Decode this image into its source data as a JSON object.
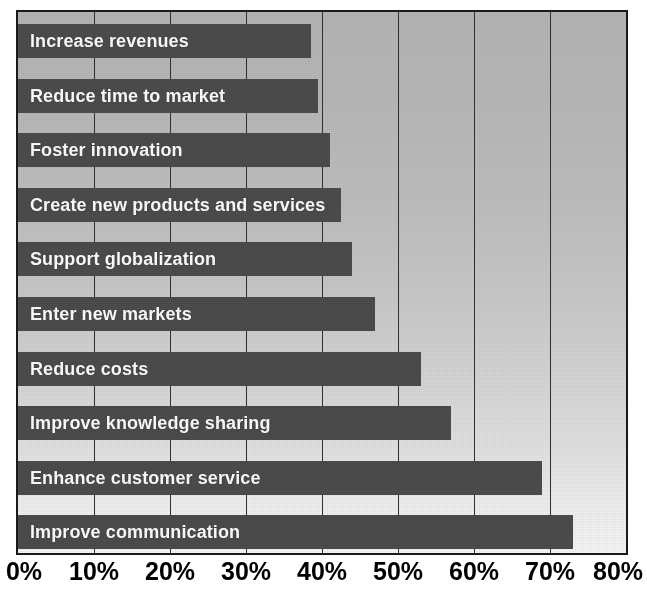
{
  "chart_data": {
    "type": "bar",
    "orientation": "horizontal",
    "title": "",
    "subtitle": "",
    "xlabel": "",
    "ylabel": "",
    "xlim": [
      0,
      80
    ],
    "xtick_labels": [
      "0%",
      "10%",
      "20%",
      "30%",
      "40%",
      "50%",
      "60%",
      "70%",
      "80%"
    ],
    "xticks": [
      0,
      10,
      20,
      30,
      40,
      50,
      60,
      70,
      80
    ],
    "grid": true,
    "grid_axis": "x",
    "legend": false,
    "legend_position": "none",
    "value_suffix": "%",
    "categories": [
      "Increase revenues",
      "Reduce time to market",
      "Foster innovation",
      "Create new products and services",
      "Support globalization",
      "Enter new markets",
      "Reduce costs",
      "Improve knowledge sharing",
      "Enhance customer service",
      "Improve communication"
    ],
    "values": [
      38.5,
      39.5,
      41,
      42.5,
      44,
      47,
      53,
      57,
      69,
      73
    ],
    "bars": [
      {
        "label": "Increase revenues",
        "value": 38.5
      },
      {
        "label": "Reduce time to market",
        "value": 39.5
      },
      {
        "label": "Foster innovation",
        "value": 41
      },
      {
        "label": "Create new products and services",
        "value": 42.5
      },
      {
        "label": "Support globalization",
        "value": 44
      },
      {
        "label": "Enter new markets",
        "value": 47
      },
      {
        "label": "Reduce costs",
        "value": 53
      },
      {
        "label": "Improve knowledge sharing",
        "value": 57
      },
      {
        "label": "Enhance customer service",
        "value": 69
      },
      {
        "label": "Improve communication",
        "value": 73
      }
    ],
    "colors": {
      "bar": "#4c4c4c",
      "bar_label_text": "#ffffff",
      "plot_background_top": "#b6b6b6",
      "plot_background_bottom": "#f7f7f7",
      "gridline": "#333333",
      "frame": "#1a1a1a",
      "tick_label": "#000000",
      "page_background": "#ffffff"
    }
  }
}
